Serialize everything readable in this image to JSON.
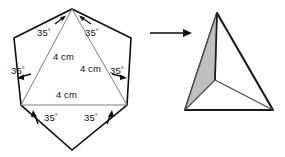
{
  "figure": {
    "net": {
      "name": "hexagonal-net",
      "angle_unit": "°",
      "angle_labels": [
        {
          "id": "angle-top-left",
          "value": "35",
          "unit": "°",
          "x": 37,
          "y": 28
        },
        {
          "id": "angle-top-right",
          "value": "35",
          "unit": "°",
          "x": 85,
          "y": 28
        },
        {
          "id": "angle-mid-left",
          "value": "35",
          "unit": "°",
          "x": 11,
          "y": 66
        },
        {
          "id": "angle-mid-right",
          "value": "35",
          "unit": "°",
          "x": 110,
          "y": 66
        },
        {
          "id": "angle-bottom-left",
          "value": "35",
          "unit": "°",
          "x": 44,
          "y": 113
        },
        {
          "id": "angle-bottom-right",
          "value": "35",
          "unit": "°",
          "x": 84,
          "y": 113
        }
      ],
      "length_labels": [
        {
          "id": "side-left",
          "value": "4 cm",
          "x": 53,
          "y": 52
        },
        {
          "id": "side-right",
          "value": "4 cm",
          "x": 80,
          "y": 64
        },
        {
          "id": "side-bottom",
          "value": "4 cm",
          "x": 56,
          "y": 90
        }
      ]
    },
    "transform_arrow": {
      "name": "transform-arrow",
      "from_x": 150,
      "to_x": 192,
      "y": 33
    },
    "solid": {
      "name": "triangular-pyramid",
      "shaded_face_color": "#bfbfbf",
      "outline_color": "#1a1a1a"
    }
  }
}
